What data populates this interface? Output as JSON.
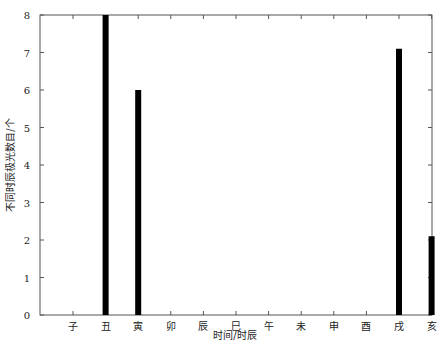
{
  "chart_data": {
    "type": "bar",
    "title": "",
    "xlabel": "时间/时辰",
    "ylabel": "不同时辰极光数目/个",
    "categories": [
      "子",
      "丑",
      "寅",
      "卯",
      "辰",
      "巳",
      "午",
      "未",
      "申",
      "酉",
      "戌",
      "亥"
    ],
    "values": [
      0,
      8,
      6,
      0,
      0,
      0,
      0,
      0,
      0,
      0,
      7.1,
      2.1
    ],
    "ylim": [
      0,
      8
    ],
    "yticks": [
      0,
      1,
      2,
      3,
      4,
      5,
      6,
      7,
      8
    ],
    "grid": false,
    "legend": null,
    "bar_color": "#000000"
  }
}
